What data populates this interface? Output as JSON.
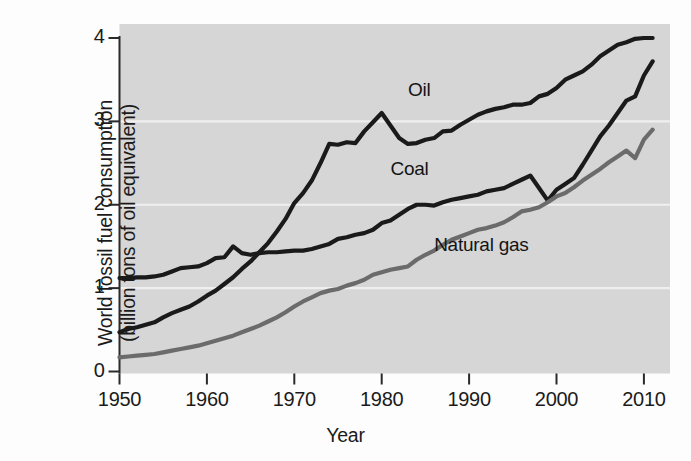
{
  "chart_data": {
    "type": "line",
    "title": "",
    "xlabel": "Year",
    "ylabel_line1": "World fossil fuel consumption",
    "ylabel_line2": "(billion tons of oil equivalent)",
    "ylabel": "World fossil fuel consumption (billion tons of oil equivalent)",
    "xlim": [
      1950,
      2011
    ],
    "ylim": [
      0,
      4
    ],
    "xticks": [
      "1950",
      "1960",
      "1970",
      "1980",
      "1990",
      "2000",
      "2010"
    ],
    "xtick_values": [
      1950,
      1960,
      1970,
      1980,
      1990,
      2000,
      2010
    ],
    "yticks": [
      "0",
      "1",
      "2",
      "3",
      "4"
    ],
    "ytick_values": [
      0,
      1,
      2,
      3,
      4
    ],
    "grid": "horizontal-white-gridlines-at-1-2-3",
    "legend_position": "inline-annotations",
    "plot_background": "#d6d6d6",
    "x": [
      1950,
      1951,
      1952,
      1953,
      1954,
      1955,
      1956,
      1957,
      1958,
      1959,
      1960,
      1961,
      1962,
      1963,
      1964,
      1965,
      1966,
      1967,
      1968,
      1969,
      1970,
      1971,
      1972,
      1973,
      1974,
      1975,
      1976,
      1977,
      1978,
      1979,
      1980,
      1981,
      1982,
      1983,
      1984,
      1985,
      1986,
      1987,
      1988,
      1989,
      1990,
      1991,
      1992,
      1993,
      1994,
      1995,
      1996,
      1997,
      1998,
      1999,
      2000,
      2001,
      2002,
      2003,
      2004,
      2005,
      2006,
      2007,
      2008,
      2009,
      2010,
      2011
    ],
    "series": [
      {
        "name": "Oil",
        "color": "#1a1a1a",
        "label_x": 1983,
        "label_y": 3.36,
        "values": [
          0.47,
          0.51,
          0.53,
          0.56,
          0.59,
          0.65,
          0.7,
          0.74,
          0.78,
          0.84,
          0.91,
          0.97,
          1.05,
          1.13,
          1.23,
          1.32,
          1.43,
          1.54,
          1.68,
          1.83,
          2.02,
          2.14,
          2.29,
          2.5,
          2.73,
          2.72,
          2.75,
          2.74,
          2.88,
          2.99,
          3.1,
          2.95,
          2.8,
          2.73,
          2.74,
          2.78,
          2.8,
          2.88,
          2.89,
          2.96,
          3.02,
          3.08,
          3.12,
          3.15,
          3.17,
          3.2,
          3.2,
          3.22,
          3.3,
          3.33,
          3.4,
          3.5,
          3.55,
          3.6,
          3.68,
          3.78,
          3.85,
          3.92,
          3.95,
          3.99,
          4.0,
          4.0
        ]
      },
      {
        "name": "Coal",
        "color": "#1a1a1a",
        "label_x": 1981,
        "label_y": 2.42,
        "values": [
          1.12,
          1.12,
          1.13,
          1.13,
          1.14,
          1.16,
          1.2,
          1.24,
          1.25,
          1.26,
          1.3,
          1.36,
          1.37,
          1.5,
          1.42,
          1.4,
          1.42,
          1.43,
          1.43,
          1.44,
          1.45,
          1.45,
          1.47,
          1.5,
          1.53,
          1.59,
          1.61,
          1.64,
          1.66,
          1.7,
          1.78,
          1.81,
          1.88,
          1.95,
          2.0,
          2.0,
          1.99,
          2.03,
          2.06,
          2.08,
          2.1,
          2.12,
          2.16,
          2.18,
          2.2,
          2.25,
          2.3,
          2.35,
          2.2,
          2.05,
          2.18,
          2.25,
          2.32,
          2.48,
          2.65,
          2.82,
          2.95,
          3.1,
          3.25,
          3.3,
          3.55,
          3.72
        ]
      },
      {
        "name": "Natural gas",
        "color": "#6b6b6b",
        "label_x": 1986,
        "label_y": 1.5,
        "values": [
          0.17,
          0.18,
          0.19,
          0.2,
          0.21,
          0.23,
          0.25,
          0.27,
          0.29,
          0.31,
          0.34,
          0.37,
          0.4,
          0.43,
          0.47,
          0.51,
          0.55,
          0.6,
          0.65,
          0.71,
          0.78,
          0.84,
          0.89,
          0.94,
          0.97,
          0.99,
          1.03,
          1.06,
          1.1,
          1.16,
          1.19,
          1.22,
          1.24,
          1.26,
          1.34,
          1.4,
          1.45,
          1.52,
          1.58,
          1.62,
          1.66,
          1.7,
          1.72,
          1.75,
          1.79,
          1.85,
          1.92,
          1.94,
          1.97,
          2.03,
          2.1,
          2.14,
          2.21,
          2.29,
          2.36,
          2.43,
          2.51,
          2.58,
          2.65,
          2.56,
          2.78,
          2.9
        ]
      }
    ]
  }
}
